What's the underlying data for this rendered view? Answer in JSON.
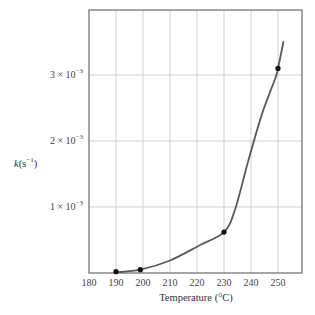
{
  "chart_data": {
    "type": "line",
    "title": "",
    "xlabel": "Temperature (°C)",
    "ylabel": "k(s⁻¹)",
    "xlim": [
      180,
      259
    ],
    "ylim": [
      0,
      0.00395
    ],
    "grid": true,
    "legend": null,
    "x_ticks": [
      180,
      190,
      200,
      210,
      220,
      230,
      240,
      250
    ],
    "x_tick_labels": [
      "180",
      "190",
      "200",
      "210",
      "220",
      "230",
      "240",
      "250"
    ],
    "y_ticks": [
      0.001,
      0.002,
      0.003
    ],
    "y_tick_labels": [
      "1 × 10⁻³",
      "2 × 10⁻³",
      "3 × 10⁻³"
    ],
    "series": [
      {
        "name": "measured points",
        "style": "markers",
        "x": [
          190,
          199,
          230,
          250
        ],
        "y": [
          2e-05,
          5e-05,
          0.00062,
          0.0031
        ]
      },
      {
        "name": "fitted curve",
        "style": "line",
        "x": [
          190,
          199,
          210,
          221,
          230,
          234,
          239,
          244,
          249,
          250,
          252
        ],
        "y": [
          1e-05,
          5e-05,
          0.00019,
          0.00042,
          0.00062,
          0.00095,
          0.0017,
          0.0024,
          0.00295,
          0.0031,
          0.0035
        ]
      }
    ],
    "colors": {
      "curve": "#5a5a5a",
      "points": "#111111",
      "grid": "#cfcfcf",
      "frame": "#6a6a6a"
    }
  },
  "labels": {
    "xlabel": "Temperature (°C)",
    "ylabel_k": "k",
    "ylabel_unit": "(s",
    "ylabel_exp": "−1",
    "ylabel_close": ")",
    "x_ticks": [
      "180",
      "190",
      "200",
      "210",
      "220",
      "230",
      "240",
      "250"
    ],
    "y_ticks": [
      {
        "mantissa": "1 × 10",
        "exp": "−3"
      },
      {
        "mantissa": "2 × 10",
        "exp": "−3"
      },
      {
        "mantissa": "3 × 10",
        "exp": "−3"
      }
    ]
  }
}
